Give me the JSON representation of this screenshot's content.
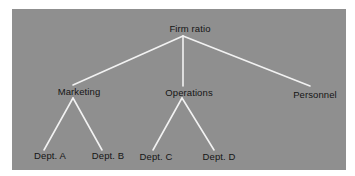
{
  "diagram": {
    "type": "tree",
    "background_color": "#8f8f8f",
    "line_color": "#f2f2f2",
    "root": {
      "label": "Firm ratio",
      "children": [
        {
          "label": "Marketing",
          "children": [
            {
              "label": "Dept. A"
            },
            {
              "label": "Dept. B"
            }
          ]
        },
        {
          "label": "Operations",
          "children": [
            {
              "label": "Dept. C"
            },
            {
              "label": "Dept. D"
            }
          ]
        },
        {
          "label": "Personnel",
          "children": []
        }
      ]
    }
  }
}
